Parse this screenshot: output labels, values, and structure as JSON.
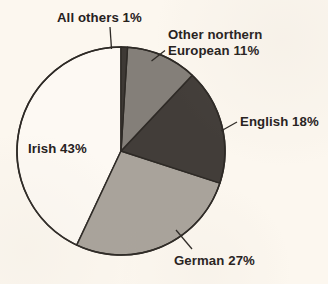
{
  "chart_data": {
    "type": "pie",
    "title": "",
    "subtitle": "",
    "xlabel": "",
    "ylabel": "",
    "legend_position": "none",
    "grid": false,
    "start_angle_deg": 0,
    "direction": "clockwise",
    "center": {
      "x": 121,
      "y": 151
    },
    "radius": 104,
    "categories": [
      "All others",
      "Other northern European",
      "English",
      "German",
      "Irish"
    ],
    "values": [
      1,
      11,
      18,
      27,
      43
    ],
    "unit": "%",
    "slices": [
      {
        "name": "All others",
        "value": 1,
        "label": "All others 1%",
        "label_lines": [
          "All others 1%"
        ],
        "color": "#3e3935",
        "start_angle_deg": 0,
        "end_angle_deg": 3.6,
        "leader": "vertical",
        "label_placement": "outside-top"
      },
      {
        "name": "Other northern European",
        "value": 11,
        "label": "Other northern European 11%",
        "label_lines": [
          "Other northern",
          "European 11%"
        ],
        "color": "#847f79",
        "start_angle_deg": 3.6,
        "end_angle_deg": 43.2,
        "leader": "diagonal",
        "label_placement": "outside-upper-right"
      },
      {
        "name": "English",
        "value": 18,
        "label": "English 18%",
        "label_lines": [
          "English 18%"
        ],
        "color": "#423d39",
        "start_angle_deg": 43.2,
        "end_angle_deg": 108.0,
        "leader": "diagonal",
        "label_placement": "outside-right"
      },
      {
        "name": "German",
        "value": 27,
        "label": "German 27%",
        "label_lines": [
          "German 27%"
        ],
        "color": "#a9a39b",
        "start_angle_deg": 108.0,
        "end_angle_deg": 205.2,
        "leader": "diagonal",
        "label_placement": "outside-bottom-right"
      },
      {
        "name": "Irish",
        "value": 43,
        "label": "Irish 43%",
        "label_lines": [
          "Irish 43%"
        ],
        "color": "#fdf9f3",
        "start_angle_deg": 205.2,
        "end_angle_deg": 360.0,
        "leader": "none",
        "label_placement": "inside-left"
      }
    ],
    "colors": {
      "background": "#fcf7ef",
      "outline": "#2e2a26",
      "label_text": "#26211d",
      "all_others": "#3e3935",
      "other_northern_european": "#847f79",
      "english": "#423d39",
      "german": "#a9a39b",
      "irish": "#fdf9f3"
    }
  }
}
